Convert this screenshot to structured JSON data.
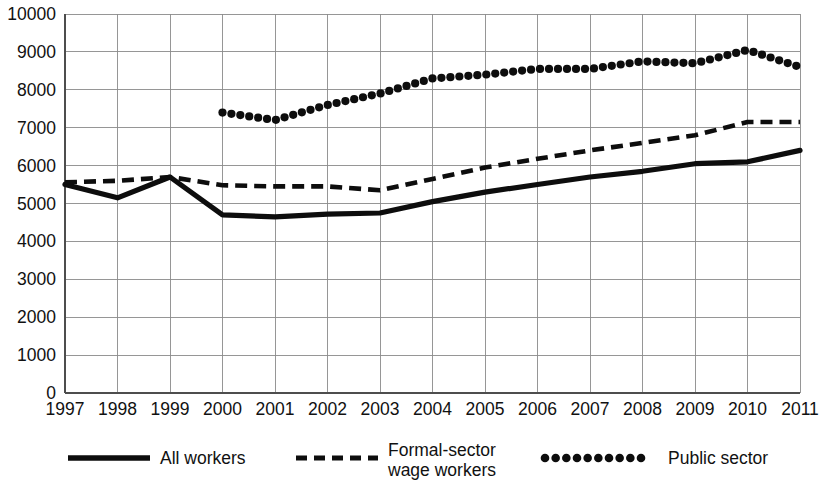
{
  "chart_data": {
    "type": "line",
    "title": "",
    "subtitle": "",
    "xlabel": "",
    "ylabel": "",
    "grid": true,
    "legend_position": "bottom",
    "xlim": [
      "1997",
      "2011"
    ],
    "ylim": [
      0,
      10000
    ],
    "ytick_step": 1000,
    "categories": [
      "1997",
      "1998",
      "1999",
      "2000",
      "2001",
      "2002",
      "2003",
      "2004",
      "2005",
      "2006",
      "2007",
      "2008",
      "2009",
      "2010",
      "2011"
    ],
    "ytick_labels": [
      "0",
      "1000",
      "2000",
      "3000",
      "4000",
      "5000",
      "6000",
      "7000",
      "8000",
      "9000",
      "10000"
    ],
    "series": [
      {
        "name": "All workers",
        "style": "solid",
        "values": [
          5500,
          5150,
          5700,
          4700,
          4650,
          4720,
          4750,
          5050,
          5300,
          5500,
          5700,
          5850,
          6050,
          6100,
          6400
        ]
      },
      {
        "name": "Formal-sector wage workers",
        "style": "dashed",
        "values": [
          5560,
          5600,
          5700,
          5480,
          5450,
          5450,
          5350,
          5650,
          5950,
          6180,
          6400,
          6600,
          6800,
          7150,
          7150
        ]
      },
      {
        "name": "Public sector",
        "style": "dotted",
        "values": [
          null,
          null,
          null,
          7400,
          7200,
          7600,
          7900,
          8300,
          8400,
          8550,
          8550,
          8750,
          8700,
          9050,
          8600
        ]
      }
    ]
  },
  "legend": {
    "items": [
      {
        "label": "All workers",
        "style": "solid"
      },
      {
        "label_line1": "Formal-sector",
        "label_line2": "wage workers",
        "style": "dashed"
      },
      {
        "label": "Public sector",
        "style": "dotted"
      }
    ]
  },
  "colors": {
    "series": "#0d0d0d",
    "grid": "#8b8b8b",
    "axis": "#4d4d4d",
    "background": "#ffffff"
  }
}
